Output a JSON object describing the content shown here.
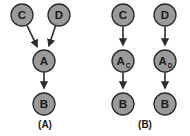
{
  "figure": {
    "background_color": "#ffffff",
    "node_fill_color": "#9a9a9a",
    "node_stroke_color": "#2b2b2b",
    "edge_color": "#2b2b2b",
    "text_color": "#1a1a1a"
  },
  "panels": [
    {
      "caption": "(A)",
      "caption_x": 45,
      "caption_y": 124,
      "nodes": [
        {
          "id": "A-C",
          "label": "C",
          "sub": "",
          "cx": 22,
          "cy": 15,
          "r": 11
        },
        {
          "id": "A-D",
          "label": "D",
          "sub": "",
          "cx": 59,
          "cy": 15,
          "r": 11
        },
        {
          "id": "A-A",
          "label": "A",
          "sub": "",
          "cx": 44,
          "cy": 61,
          "r": 11
        },
        {
          "id": "A-B",
          "label": "B",
          "sub": "",
          "cx": 44,
          "cy": 104,
          "r": 11
        }
      ],
      "edges": [
        {
          "from": "A-C",
          "to": "A-A"
        },
        {
          "from": "A-D",
          "to": "A-A"
        },
        {
          "from": "A-A",
          "to": "A-B"
        }
      ]
    },
    {
      "caption": "(B)",
      "caption_x": 145,
      "caption_y": 124,
      "nodes": [
        {
          "id": "B-C",
          "label": "C",
          "sub": "",
          "cx": 123,
          "cy": 15,
          "r": 11
        },
        {
          "id": "B-D",
          "label": "D",
          "sub": "",
          "cx": 165,
          "cy": 15,
          "r": 11
        },
        {
          "id": "B-AC",
          "label": "A",
          "sub": "C",
          "cx": 123,
          "cy": 61,
          "r": 11
        },
        {
          "id": "B-AD",
          "label": "A",
          "sub": "D",
          "cx": 165,
          "cy": 61,
          "r": 11
        },
        {
          "id": "B-B1",
          "label": "B",
          "sub": "",
          "cx": 123,
          "cy": 104,
          "r": 11
        },
        {
          "id": "B-B2",
          "label": "B",
          "sub": "",
          "cx": 165,
          "cy": 104,
          "r": 11
        }
      ],
      "edges": [
        {
          "from": "B-C",
          "to": "B-AC"
        },
        {
          "from": "B-D",
          "to": "B-AD"
        },
        {
          "from": "B-AC",
          "to": "B-B1"
        },
        {
          "from": "B-AD",
          "to": "B-B2"
        }
      ]
    }
  ]
}
